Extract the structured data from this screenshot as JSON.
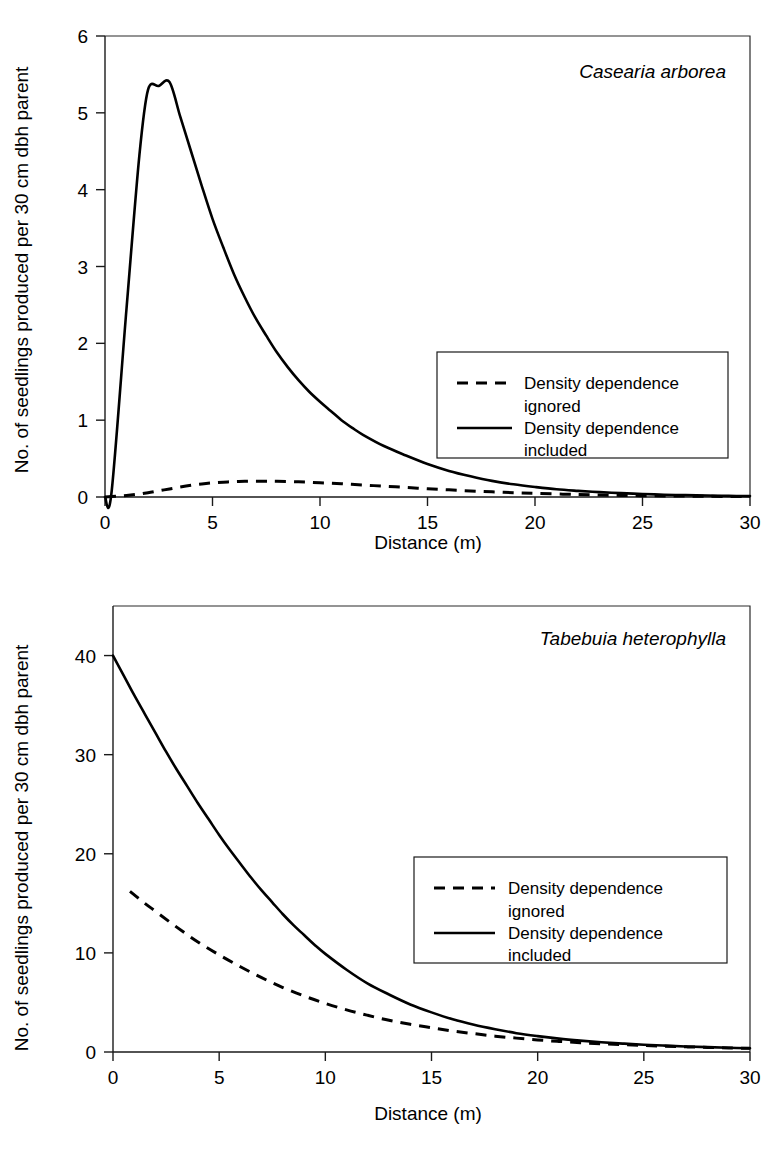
{
  "figure": {
    "panels": [
      "top",
      "bottom"
    ]
  },
  "chart_data": [
    {
      "id": "casearia",
      "type": "line",
      "title": "Casearia arborea",
      "title_style": "italic",
      "xlabel": "Distance (m)",
      "ylabel": "No. of seedlings produced per 30 cm dbh parent",
      "xlim": [
        0,
        30
      ],
      "ylim": [
        0,
        6
      ],
      "xticks": [
        0,
        5,
        10,
        15,
        20,
        25,
        30
      ],
      "xticklabels": [
        "0",
        "5",
        "10",
        "15",
        "20",
        "25",
        "30"
      ],
      "yticks": [
        0,
        1,
        2,
        3,
        4,
        5,
        6
      ],
      "yticklabels": [
        "0",
        "1",
        "2",
        "3",
        "4",
        "5",
        "6"
      ],
      "grid": false,
      "legend_position": "center-right",
      "series": [
        {
          "name": "Density dependence ignored",
          "style": "dashed",
          "color": "#000000",
          "x": [
            0,
            0.5,
            1,
            1.5,
            2,
            2.5,
            3,
            3.5,
            4,
            4.5,
            5,
            5.5,
            6,
            6.5,
            7,
            7.5,
            8,
            9,
            10,
            11,
            12,
            13,
            14,
            15,
            16,
            17,
            18,
            19,
            20,
            22,
            24,
            26,
            28,
            30
          ],
          "y": [
            0,
            0.01,
            0.02,
            0.035,
            0.055,
            0.08,
            0.105,
            0.13,
            0.152,
            0.17,
            0.184,
            0.193,
            0.2,
            0.204,
            0.206,
            0.206,
            0.204,
            0.197,
            0.186,
            0.172,
            0.156,
            0.14,
            0.124,
            0.108,
            0.093,
            0.079,
            0.067,
            0.056,
            0.047,
            0.032,
            0.021,
            0.014,
            0.009,
            0.005
          ]
        },
        {
          "name": "Density dependence included",
          "style": "solid",
          "color": "#000000",
          "x": [
            0,
            0.3,
            1,
            1.6,
            2,
            2.5,
            3,
            3.5,
            4,
            4.5,
            5,
            5.5,
            6,
            6.5,
            7,
            7.5,
            8,
            8.5,
            9,
            9.5,
            10,
            10.5,
            11,
            11.5,
            12,
            13,
            14,
            15,
            16,
            17,
            18,
            19,
            20,
            21,
            22,
            23,
            24,
            25,
            26,
            27,
            28,
            29,
            30
          ],
          "y": [
            0.0,
            0.05,
            2.45,
            4.45,
            5.3,
            5.35,
            5.4,
            4.95,
            4.5,
            4.05,
            3.62,
            3.25,
            2.9,
            2.6,
            2.33,
            2.1,
            1.88,
            1.69,
            1.52,
            1.37,
            1.24,
            1.12,
            1.0,
            0.9,
            0.81,
            0.66,
            0.54,
            0.43,
            0.34,
            0.27,
            0.21,
            0.165,
            0.13,
            0.1,
            0.08,
            0.063,
            0.05,
            0.039,
            0.03,
            0.024,
            0.019,
            0.015,
            0.012
          ]
        }
      ]
    },
    {
      "id": "tabebuia",
      "type": "line",
      "title": "Tabebuia heterophylla",
      "title_style": "italic",
      "xlabel": "Distance (m)",
      "ylabel": "No. of seedlings produced per 30 cm dbh parent",
      "xlim": [
        0,
        30
      ],
      "ylim": [
        0,
        45
      ],
      "xticks": [
        0,
        5,
        10,
        15,
        20,
        25,
        30
      ],
      "xticklabels": [
        "0",
        "5",
        "10",
        "15",
        "20",
        "25",
        "30"
      ],
      "yticks": [
        0,
        10,
        20,
        30,
        40
      ],
      "yticklabels": [
        "0",
        "10",
        "20",
        "30",
        "40"
      ],
      "grid": false,
      "legend_position": "center-right",
      "series": [
        {
          "name": "Density dependence ignored",
          "style": "dashed",
          "color": "#000000",
          "x": [
            0.8,
            1.5,
            2,
            3,
            4,
            5,
            6,
            7,
            8,
            9,
            10,
            11,
            12,
            13,
            14,
            15,
            16,
            17,
            18,
            19,
            20,
            21,
            22,
            23,
            24,
            25,
            26,
            27,
            28,
            29,
            30
          ],
          "y": [
            16.2,
            15.0,
            14.2,
            12.6,
            11.1,
            9.8,
            8.6,
            7.5,
            6.5,
            5.65,
            4.9,
            4.25,
            3.7,
            3.2,
            2.8,
            2.45,
            2.12,
            1.85,
            1.6,
            1.4,
            1.22,
            1.07,
            0.94,
            0.83,
            0.74,
            0.66,
            0.58,
            0.52,
            0.46,
            0.41,
            0.37
          ]
        },
        {
          "name": "Density dependence included",
          "style": "solid",
          "color": "#000000",
          "x": [
            0,
            0.5,
            1,
            1.5,
            2,
            2.5,
            3,
            3.5,
            4,
            4.5,
            5,
            5.5,
            6,
            6.5,
            7,
            7.5,
            8,
            8.5,
            9,
            9.5,
            10,
            11,
            12,
            13,
            14,
            15,
            16,
            17,
            18,
            19,
            20,
            21,
            22,
            23,
            24,
            25,
            26,
            27,
            28,
            29,
            30
          ],
          "y": [
            40.0,
            38.0,
            36.0,
            34.1,
            32.2,
            30.3,
            28.5,
            26.8,
            25.1,
            23.5,
            21.9,
            20.4,
            19.0,
            17.6,
            16.3,
            15.1,
            13.9,
            12.8,
            11.8,
            10.8,
            9.9,
            8.3,
            6.9,
            5.8,
            4.8,
            4.0,
            3.3,
            2.75,
            2.3,
            1.9,
            1.6,
            1.35,
            1.15,
            0.98,
            0.85,
            0.73,
            0.64,
            0.56,
            0.49,
            0.43,
            0.38
          ]
        }
      ]
    }
  ],
  "legend": {
    "items": [
      {
        "style": "dashed",
        "line1": "Density dependence",
        "line2": "ignored"
      },
      {
        "style": "solid",
        "line1": "Density dependence",
        "line2": "included"
      }
    ]
  },
  "colors": {
    "ink": "#000000",
    "frame": "#2a2a2a",
    "background": "#ffffff"
  }
}
